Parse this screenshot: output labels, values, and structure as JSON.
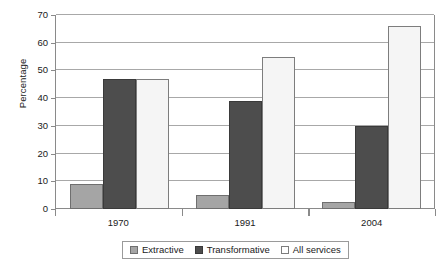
{
  "chart_data": {
    "type": "bar",
    "title": "",
    "subtitle": "",
    "xlabel": "",
    "ylabel": "Percentage",
    "categories": [
      "1970",
      "1991",
      "2004"
    ],
    "series": [
      {
        "name": "Extractive",
        "values": [
          9,
          5,
          2.5
        ],
        "color": "#a5a5a5"
      },
      {
        "name": "Transformative",
        "values": [
          47,
          39,
          30
        ],
        "color": "#4d4d4d"
      },
      {
        "name": "All services",
        "values": [
          47,
          55,
          66
        ],
        "color": "#f5f5f5"
      }
    ],
    "ylim": [
      0,
      70
    ],
    "ytick_step": 10,
    "yticks": [
      0,
      10,
      20,
      30,
      40,
      50,
      60,
      70
    ],
    "ytick_labels": [
      "0",
      "10",
      "20",
      "30",
      "40",
      "50",
      "60",
      "70"
    ],
    "grid": true,
    "grid_axis": "y",
    "legend": true,
    "legend_position": "bottom",
    "legend_entries": [
      "Extractive",
      "Transformative",
      "All services"
    ]
  }
}
